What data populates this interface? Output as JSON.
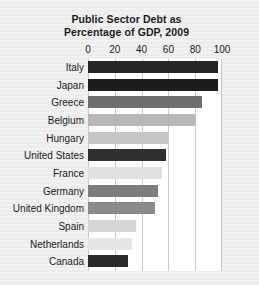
{
  "chart_data": {
    "type": "bar",
    "orientation": "horizontal",
    "title": "Public Sector Debt as Percentage of GDP, 2009",
    "title_lines": [
      "Public Sector Debt as",
      "Percentage of GDP, 2009"
    ],
    "xlabel": "",
    "ylabel": "",
    "xlim": [
      0,
      100
    ],
    "xticks": [
      0,
      20,
      40,
      60,
      80,
      100
    ],
    "xtick_labels": [
      "0",
      "20",
      "40",
      "60",
      "80",
      "100"
    ],
    "grid": true,
    "grid_axis": "x",
    "legend": false,
    "plot_background": "#ffffff",
    "page_background": "#ecedec",
    "categories": [
      "Italy",
      "Japan",
      "Greece",
      "Belgium",
      "Hungary",
      "United States",
      "France",
      "Germany",
      "United Kingdom",
      "Spain",
      "Netherlands",
      "Canada"
    ],
    "values": [
      97,
      97,
      85,
      80,
      60,
      58,
      55,
      52,
      50,
      36,
      33,
      30
    ],
    "bar_colors": [
      "#262626",
      "#1c1c1c",
      "#6f6f6f",
      "#b7b7b7",
      "#c6c6c6",
      "#303030",
      "#e0e0e0",
      "#7d7d7d",
      "#8a8a8a",
      "#d5d5d5",
      "#e6e6e6",
      "#2b2b2b"
    ],
    "bars": [
      {
        "label": "Italy",
        "value": 97,
        "color": "#262626"
      },
      {
        "label": "Japan",
        "value": 97,
        "color": "#1c1c1c"
      },
      {
        "label": "Greece",
        "value": 85,
        "color": "#6f6f6f"
      },
      {
        "label": "Belgium",
        "value": 80,
        "color": "#b7b7b7"
      },
      {
        "label": "Hungary",
        "value": 60,
        "color": "#c6c6c6"
      },
      {
        "label": "United States",
        "value": 58,
        "color": "#303030"
      },
      {
        "label": "France",
        "value": 55,
        "color": "#e0e0e0"
      },
      {
        "label": "Germany",
        "value": 52,
        "color": "#7d7d7d"
      },
      {
        "label": "United Kingdom",
        "value": 50,
        "color": "#8a8a8a"
      },
      {
        "label": "Spain",
        "value": 36,
        "color": "#d5d5d5"
      },
      {
        "label": "Netherlands",
        "value": 33,
        "color": "#e6e6e6"
      },
      {
        "label": "Canada",
        "value": 30,
        "color": "#2b2b2b"
      }
    ]
  }
}
